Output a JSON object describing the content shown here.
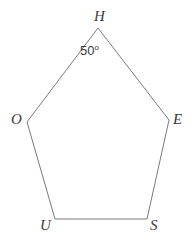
{
  "figure": {
    "type": "polygon",
    "shape_name": "pentagon",
    "background_color": "#ffffff",
    "stroke_color": "#7a7a7a",
    "stroke_width": 1,
    "text_color": "#3a3a3a",
    "width": 196,
    "height": 241,
    "vertices": [
      {
        "label": "H",
        "x": 98,
        "y": 28,
        "label_x": 94,
        "label_y": 9
      },
      {
        "label": "E",
        "x": 169,
        "y": 120,
        "label_x": 173,
        "label_y": 112
      },
      {
        "label": "S",
        "x": 147,
        "y": 219,
        "label_x": 150,
        "label_y": 218
      },
      {
        "label": "U",
        "x": 55,
        "y": 219,
        "label_x": 40,
        "label_y": 218
      },
      {
        "label": "O",
        "x": 27,
        "y": 122,
        "label_x": 11,
        "label_y": 112
      }
    ],
    "edges": [
      {
        "from": "H",
        "to": "E"
      },
      {
        "from": "E",
        "to": "S"
      },
      {
        "from": "S",
        "to": "U"
      },
      {
        "from": "U",
        "to": "O"
      },
      {
        "from": "O",
        "to": "H"
      }
    ],
    "angle_labels": [
      {
        "at_vertex": "H",
        "value": "50",
        "degree_symbol": "o",
        "full_text": "50°",
        "x": 80,
        "y": 44
      }
    ]
  }
}
